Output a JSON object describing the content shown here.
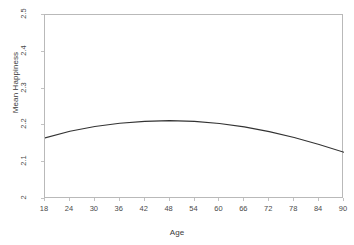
{
  "chart_data": {
    "type": "line",
    "title": "",
    "xlabel": "Age",
    "ylabel": "Mean Happiness",
    "xlim": [
      18,
      90
    ],
    "ylim": [
      2,
      2.5
    ],
    "grid": false,
    "legend": null,
    "xticks": [
      "18",
      "24",
      "30",
      "36",
      "42",
      "48",
      "54",
      "60",
      "66",
      "72",
      "78",
      "84",
      "90"
    ],
    "yticks": [
      "2",
      "2.1",
      "2.2",
      "2.3",
      "2.4",
      "2.5"
    ],
    "series": [
      {
        "name": "Mean Happiness",
        "color": "#333333",
        "x": [
          18,
          24,
          30,
          36,
          42,
          48,
          54,
          60,
          66,
          72,
          78,
          84,
          90
        ],
        "values": [
          2.166,
          2.184,
          2.197,
          2.206,
          2.211,
          2.213,
          2.211,
          2.205,
          2.196,
          2.183,
          2.167,
          2.148,
          2.127
        ]
      }
    ]
  },
  "axes": {
    "y_title": "Mean Happiness",
    "x_title": "Age"
  },
  "colors": {
    "curve": "#333333",
    "frame": "#b9b9b9",
    "tick": "#c2c2c2",
    "text": "#4a4a4a",
    "background": "#ffffff"
  }
}
